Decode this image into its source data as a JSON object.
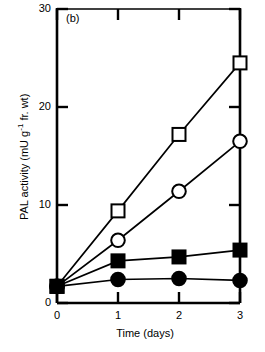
{
  "panel": {
    "label": "(b)"
  },
  "axes": {
    "y_title_prefix": "PAL activity (mU g",
    "y_title_exponent": "-1",
    "y_title_suffix": " fr. wt)",
    "x_title": "Time (days)",
    "y_ticks": [
      "0",
      "10",
      "20",
      "30"
    ],
    "x_ticks": [
      "0",
      "1",
      "2",
      "3"
    ]
  },
  "chart_data": {
    "type": "line",
    "title": "(b)",
    "xlabel": "Time (days)",
    "ylabel": "PAL activity (mU g-1 fr. wt)",
    "xlim": [
      0,
      3
    ],
    "ylim": [
      0,
      30
    ],
    "xticks": [
      0,
      1,
      2,
      3
    ],
    "yticks": [
      0,
      10,
      20,
      30
    ],
    "grid": false,
    "legend": "none",
    "x": [
      0,
      1,
      2,
      3
    ],
    "series": [
      {
        "name": "open-square",
        "marker": "open-square",
        "values": [
          1.7,
          9.4,
          17.2,
          24.5
        ]
      },
      {
        "name": "open-circle",
        "marker": "open-circle",
        "values": [
          1.7,
          6.4,
          11.4,
          16.5
        ]
      },
      {
        "name": "filled-square",
        "marker": "filled-square",
        "values": [
          1.7,
          4.3,
          4.7,
          5.4
        ]
      },
      {
        "name": "filled-circle",
        "marker": "filled-circle",
        "values": [
          1.7,
          2.4,
          2.5,
          2.3
        ]
      }
    ]
  }
}
